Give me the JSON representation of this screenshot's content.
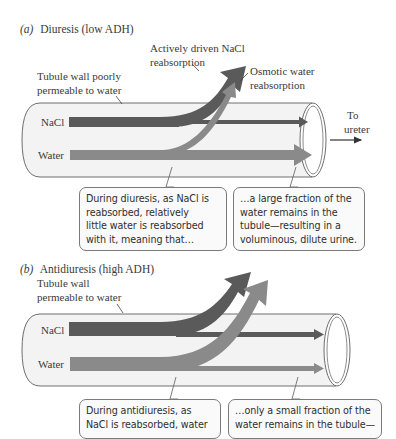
{
  "colors": {
    "nacl_arrow": "#5a5a5a",
    "water_arrow": "#8a8a8a",
    "tube_fill": "#f3f3f3",
    "tube_stroke": "#6e6e6e"
  },
  "panel_a": {
    "letter": "a",
    "title": "Diuresis (low ADH)",
    "wall_label": [
      "Tubule wall poorly",
      "permeable to water"
    ],
    "nacl_label": [
      "Actively driven NaCl",
      "reabsorption"
    ],
    "water_reabs_label": [
      "Osmotic water",
      "reabsorption"
    ],
    "exit_label": [
      "To",
      "ureter"
    ],
    "row_labels": {
      "nacl": "NaCl",
      "water": "Water"
    },
    "callout_left": [
      "During diuresis, as NaCl is",
      "reabsorbed, relatively",
      "little water is reabsorbed",
      "with it, meaning that…"
    ],
    "callout_right": [
      "…a large fraction of the",
      "water remains in the",
      "tubule—resulting in a",
      "voluminous, dilute urine."
    ]
  },
  "panel_b": {
    "letter": "b",
    "title": "Antidiuresis (high ADH)",
    "wall_label": [
      "Tubule wall",
      "permeable to water"
    ],
    "row_labels": {
      "nacl": "NaCl",
      "water": "Water"
    },
    "callout_left": [
      "During antidiuresis, as",
      "NaCl is reabsorbed, water"
    ],
    "callout_right": [
      "…only a small fraction of the",
      "water remains in the tubule—"
    ]
  }
}
